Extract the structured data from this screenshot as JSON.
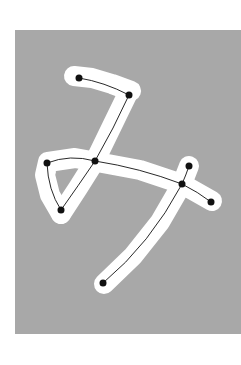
{
  "figure": {
    "width": 241,
    "height": 365,
    "background": "#ffffff",
    "panel": {
      "x": 15,
      "y": 30,
      "width": 226,
      "height": 304,
      "color": "#a8a8a8"
    },
    "glyph": {
      "color": "#ffffff",
      "stroke_width": 20
    },
    "strokes": [
      [
        [
          74,
          76
        ],
        [
          92,
          78
        ],
        [
          112,
          84
        ],
        [
          131,
          91
        ]
      ],
      [
        [
          128,
          93
        ],
        [
          111,
          128
        ],
        [
          95,
          161
        ],
        [
          78,
          188
        ],
        [
          61,
          214
        ]
      ],
      [
        [
          61,
          214
        ],
        [
          50,
          195
        ],
        [
          45,
          175
        ],
        [
          48,
          162
        ],
        [
          75,
          158
        ],
        [
          97,
          162
        ],
        [
          140,
          170
        ],
        [
          182,
          184
        ],
        [
          212,
          201
        ]
      ],
      [
        [
          189,
          166
        ],
        [
          182,
          184
        ],
        [
          160,
          222
        ],
        [
          133,
          256
        ],
        [
          104,
          284
        ]
      ]
    ],
    "skeleton": {
      "edge_color": "#111111",
      "node_color": "#111111",
      "node_radius": 3.5,
      "nodes": [
        {
          "id": "n1",
          "x": 79,
          "y": 78
        },
        {
          "id": "n2",
          "x": 129,
          "y": 95
        },
        {
          "id": "n3",
          "x": 47,
          "y": 163
        },
        {
          "id": "n4",
          "x": 95,
          "y": 161
        },
        {
          "id": "n5",
          "x": 61,
          "y": 210
        },
        {
          "id": "n6",
          "x": 189,
          "y": 166
        },
        {
          "id": "n7",
          "x": 182,
          "y": 184
        },
        {
          "id": "n8",
          "x": 211,
          "y": 202
        },
        {
          "id": "n9",
          "x": 103,
          "y": 283
        }
      ],
      "edges": [
        {
          "from": "n1",
          "to": "n2",
          "ctrl": [
            104,
            82
          ]
        },
        {
          "from": "n2",
          "to": "n4",
          "ctrl": [
            114,
            128
          ]
        },
        {
          "from": "n4",
          "to": "n5",
          "ctrl": [
            78,
            186
          ]
        },
        {
          "from": "n5",
          "to": "n3",
          "ctrl": [
            48,
            190
          ]
        },
        {
          "from": "n3",
          "to": "n4",
          "ctrl": [
            70,
            154
          ]
        },
        {
          "from": "n4",
          "to": "n7",
          "ctrl": [
            140,
            168
          ]
        },
        {
          "from": "n7",
          "to": "n8",
          "ctrl": [
            198,
            192
          ]
        },
        {
          "from": "n6",
          "to": "n7",
          "ctrl": [
            186,
            175
          ]
        },
        {
          "from": "n7",
          "to": "n9",
          "ctrl": [
            150,
            244
          ]
        }
      ]
    }
  }
}
